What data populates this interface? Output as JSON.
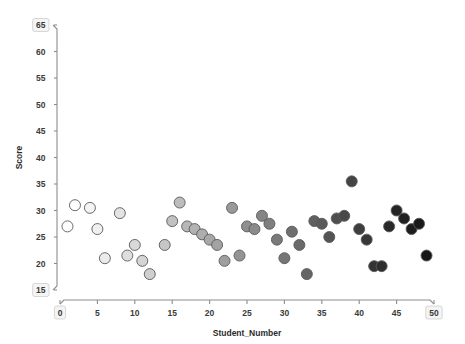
{
  "chart_data": {
    "type": "scatter",
    "title": "",
    "xlabel": "Student_Number",
    "ylabel": "Score",
    "xlim": [
      0,
      50
    ],
    "ylim": [
      15,
      65
    ],
    "xticks": [
      0,
      5,
      10,
      15,
      20,
      25,
      30,
      35,
      40,
      45,
      50
    ],
    "yticks": [
      15,
      20,
      25,
      30,
      35,
      40,
      45,
      50,
      55,
      60,
      65
    ],
    "grid": false,
    "legend": null,
    "marker": {
      "shape": "circle",
      "size_px": 11,
      "edge_color": "#5a5a5a",
      "colormap": "grayscale-light-to-dark",
      "color_by": "Student_Number",
      "color_start": "#ffffff",
      "color_end": "#1a1a1a"
    },
    "x": [
      2,
      1,
      4,
      5,
      6,
      8,
      9,
      10,
      11,
      12,
      14,
      15,
      16,
      17,
      18,
      19,
      20,
      21,
      22,
      23,
      24,
      25,
      26,
      27,
      28,
      29,
      30,
      31,
      32,
      33,
      34,
      35,
      36,
      37,
      38,
      39,
      40,
      41,
      42,
      43,
      44,
      45,
      46,
      47,
      48,
      49
    ],
    "y": [
      31,
      27,
      30.5,
      26.5,
      21,
      29.5,
      21.5,
      23.5,
      20.5,
      18,
      23.5,
      28,
      31.5,
      27,
      26.5,
      25.5,
      24.5,
      23.5,
      20.5,
      30.5,
      21.5,
      27,
      26.5,
      29,
      27.5,
      24.5,
      21,
      26,
      23.5,
      18,
      28,
      27.5,
      25,
      28.5,
      29,
      35.5,
      26.5,
      24.5,
      19.5,
      19.5,
      27,
      30,
      28.5,
      26.5,
      27.5,
      21.5
    ],
    "points": [
      {
        "x": 2,
        "y": 31,
        "color": "#ffffff"
      },
      {
        "x": 1,
        "y": 27,
        "color": "#fefefe"
      },
      {
        "x": 4,
        "y": 30.5,
        "color": "#f4f4f4"
      },
      {
        "x": 5,
        "y": 26.5,
        "color": "#f0f0f0"
      },
      {
        "x": 6,
        "y": 21,
        "color": "#ebebeb"
      },
      {
        "x": 8,
        "y": 29.5,
        "color": "#e3e3e3"
      },
      {
        "x": 9,
        "y": 21.5,
        "color": "#dedede"
      },
      {
        "x": 10,
        "y": 23.5,
        "color": "#d9d9d9"
      },
      {
        "x": 11,
        "y": 20.5,
        "color": "#d4d4d4"
      },
      {
        "x": 12,
        "y": 18,
        "color": "#cfcfcf"
      },
      {
        "x": 14,
        "y": 23.5,
        "color": "#c6c6c6"
      },
      {
        "x": 15,
        "y": 28,
        "color": "#c1c1c1"
      },
      {
        "x": 16,
        "y": 31.5,
        "color": "#bcbcbc"
      },
      {
        "x": 17,
        "y": 27,
        "color": "#b7b7b7"
      },
      {
        "x": 18,
        "y": 26.5,
        "color": "#b2b2b2"
      },
      {
        "x": 19,
        "y": 25.5,
        "color": "#adadad"
      },
      {
        "x": 20,
        "y": 24.5,
        "color": "#a8a8a8"
      },
      {
        "x": 21,
        "y": 23.5,
        "color": "#a3a3a3"
      },
      {
        "x": 22,
        "y": 20.5,
        "color": "#9e9e9e"
      },
      {
        "x": 23,
        "y": 30.5,
        "color": "#999999"
      },
      {
        "x": 24,
        "y": 21.5,
        "color": "#949494"
      },
      {
        "x": 25,
        "y": 27,
        "color": "#8f8f8f"
      },
      {
        "x": 26,
        "y": 26.5,
        "color": "#8a8a8a"
      },
      {
        "x": 27,
        "y": 29,
        "color": "#858585"
      },
      {
        "x": 28,
        "y": 27.5,
        "color": "#7f7f7f"
      },
      {
        "x": 29,
        "y": 24.5,
        "color": "#7a7a7a"
      },
      {
        "x": 30,
        "y": 21,
        "color": "#757575"
      },
      {
        "x": 31,
        "y": 26,
        "color": "#6f6f6f"
      },
      {
        "x": 32,
        "y": 23.5,
        "color": "#6a6a6a"
      },
      {
        "x": 33,
        "y": 18,
        "color": "#656565"
      },
      {
        "x": 34,
        "y": 28,
        "color": "#5f5f5f"
      },
      {
        "x": 35,
        "y": 27.5,
        "color": "#5a5a5a"
      },
      {
        "x": 36,
        "y": 25,
        "color": "#545454"
      },
      {
        "x": 37,
        "y": 28.5,
        "color": "#4f4f4f"
      },
      {
        "x": 38,
        "y": 29,
        "color": "#494949"
      },
      {
        "x": 39,
        "y": 35.5,
        "color": "#444444"
      },
      {
        "x": 40,
        "y": 26.5,
        "color": "#3e3e3e"
      },
      {
        "x": 41,
        "y": 24.5,
        "color": "#383838"
      },
      {
        "x": 42,
        "y": 19.5,
        "color": "#333333"
      },
      {
        "x": 43,
        "y": 19.5,
        "color": "#2e2e2e"
      },
      {
        "x": 44,
        "y": 27,
        "color": "#292929"
      },
      {
        "x": 45,
        "y": 30,
        "color": "#242424"
      },
      {
        "x": 46,
        "y": 28.5,
        "color": "#202020"
      },
      {
        "x": 47,
        "y": 26.5,
        "color": "#1d1d1d"
      },
      {
        "x": 48,
        "y": 27.5,
        "color": "#1a1a1a"
      },
      {
        "x": 49,
        "y": 21.5,
        "color": "#161616"
      }
    ]
  }
}
